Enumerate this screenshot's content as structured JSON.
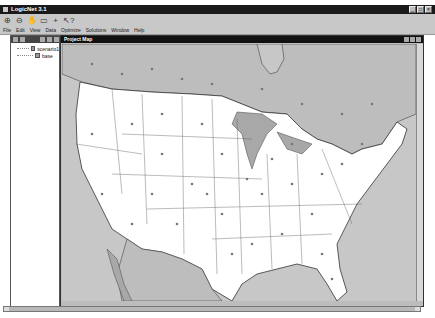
{
  "window": {
    "title": "LogicNet 3.1",
    "controls": [
      "minimize",
      "maximize",
      "close"
    ]
  },
  "toolbar": {
    "tools": [
      {
        "name": "zoom-in-icon",
        "glyph": "⊕"
      },
      {
        "name": "zoom-out-icon",
        "glyph": "⊖"
      },
      {
        "name": "pan-hand-icon",
        "glyph": "✋"
      },
      {
        "name": "select-rect-icon",
        "glyph": "▭"
      },
      {
        "name": "add-point-icon",
        "glyph": "+"
      },
      {
        "name": "help-pointer-icon",
        "glyph": "↖?"
      }
    ]
  },
  "menubar": {
    "items": [
      "File",
      "Edit",
      "View",
      "Data",
      "Optimize",
      "Solutions",
      "Window",
      "Help"
    ]
  },
  "scenario_panel": {
    "items": [
      {
        "label": "scenario1"
      },
      {
        "label": "base"
      }
    ]
  },
  "map_window": {
    "title": "Project Map",
    "colors": {
      "water": "#c7c7c7",
      "canada_mexico": "#bdbdbd",
      "usa_land": "#ffffff",
      "borders": "#333333",
      "points": "#777777"
    }
  }
}
